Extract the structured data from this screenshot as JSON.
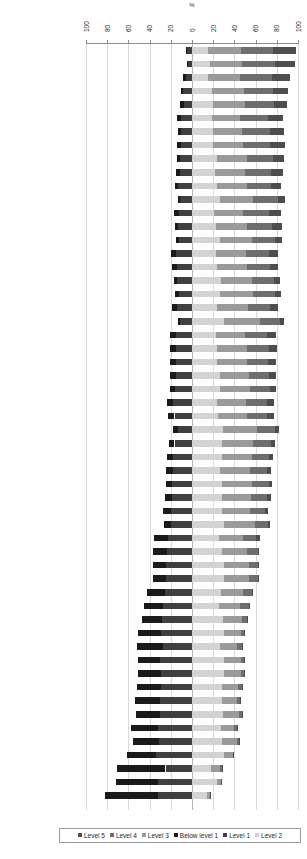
{
  "chart_data": {
    "type": "bar",
    "subtype": "diverging-stacked-bar",
    "title": "",
    "xlabel": "%",
    "ylabel": "",
    "xlim": [
      -100,
      100
    ],
    "xticks": [
      100,
      80,
      60,
      40,
      20,
      0,
      20,
      40,
      60,
      80,
      100
    ],
    "grid": true,
    "legend_position": "bottom",
    "orientation": "horizontal",
    "axis_origin_note": "Bars diverge at 0; below-baseline levels extend left, at/above-baseline levels extend right",
    "negative_series_order": [
      "Level 1",
      "Below level 1"
    ],
    "positive_series_order": [
      "Level 2",
      "Level 3",
      "Level 4",
      "Level 5"
    ],
    "legend_entries": [
      {
        "label": "Level 5",
        "color": "#4d4d4d"
      },
      {
        "label": "Level 4",
        "color": "#6e6e6e"
      },
      {
        "label": "Level 3",
        "color": "#9a9a9a"
      },
      {
        "label": "Below level 1",
        "color": "#1a1a1a"
      },
      {
        "label": "Level 1",
        "color": "#3f3f3f"
      },
      {
        "label": "Level 2",
        "color": "#d3d3d3"
      }
    ],
    "series": [
      {
        "name": "Below level 1",
        "color": "#1a1a1a"
      },
      {
        "name": "Level 1",
        "color": "#3f3f3f"
      },
      {
        "name": "Level 2",
        "color": "#d3d3d3"
      },
      {
        "name": "Level 3",
        "color": "#9a9a9a"
      },
      {
        "name": "Level 4",
        "color": "#6e6e6e"
      },
      {
        "name": "Level 5",
        "color": "#4d4d4d"
      }
    ],
    "categories": [
      "Korea",
      "Finland",
      "Hong Kong-China",
      "Canada",
      "Ireland",
      "New Zealand",
      "Liechtenstein",
      "Australia",
      "Netherlands",
      "Sweden",
      "Poland",
      "Estonia",
      "Belgium",
      "Switzerland",
      "Chinese Taipei",
      "Germany",
      "Japan",
      "Slovenia",
      "Denmark",
      "United Kingdom",
      "Macao-China",
      "France",
      "Austria",
      "Iceland",
      "Norway",
      "Hungary",
      "Czech Republic",
      "Luxembourg",
      "Latvia",
      "Croatia",
      "Portugal",
      "Italy",
      "Lithuania",
      "Slovak Republic",
      "Greece",
      "Spain",
      "Israel",
      "Turkey",
      "Chile",
      "Russian Federation",
      "Uruguay",
      "Bulgaria",
      "Mexico",
      "Thailand",
      "Argentina",
      "Serbia",
      "Jordan",
      "Brazil",
      "Colombia",
      "Romania",
      "Montenegro",
      "Tunisia",
      "Indonesia",
      "Qatar",
      "Azerbaijan",
      "Kyrgyzstan"
    ],
    "values": [
      {
        "country": "Korea",
        "below_level_1": 1.4,
        "level_1": 4.4,
        "level_2": 15.4,
        "level_3": 30.8,
        "level_4": 30.6,
        "level_5": 21.7
      },
      {
        "country": "Finland",
        "below_level_1": 1.1,
        "level_1": 3.7,
        "level_2": 16.7,
        "level_3": 30.7,
        "level_4": 31.1,
        "level_5": 18.5
      },
      {
        "country": "Hong Kong-China",
        "below_level_1": 2.2,
        "level_1": 5.9,
        "level_2": 15.0,
        "level_3": 30.0,
        "level_4": 30.5,
        "level_5": 17.4
      },
      {
        "country": "Canada",
        "below_level_1": 2.4,
        "level_1": 8.1,
        "level_2": 19.0,
        "level_3": 30.0,
        "level_4": 27.0,
        "level_5": 14.5
      },
      {
        "country": "Ireland",
        "below_level_1": 3.3,
        "level_1": 8.0,
        "level_2": 20.0,
        "level_3": 30.0,
        "level_4": 27.5,
        "level_5": 11.7
      },
      {
        "country": "New Zealand",
        "below_level_1": 4.0,
        "level_1": 10.5,
        "level_2": 19.0,
        "level_3": 26.5,
        "level_4": 26.0,
        "level_5": 14.5
      },
      {
        "country": "Liechtenstein",
        "below_level_1": 3.6,
        "level_1": 10.0,
        "level_2": 20.0,
        "level_3": 27.0,
        "level_4": 26.5,
        "level_5": 13.0
      },
      {
        "country": "Australia",
        "below_level_1": 3.8,
        "level_1": 10.3,
        "level_2": 20.0,
        "level_3": 28.0,
        "level_4": 26.0,
        "level_5": 13.5
      },
      {
        "country": "Netherlands",
        "below_level_1": 2.9,
        "level_1": 11.6,
        "level_2": 24.0,
        "level_3": 28.0,
        "level_4": 24.5,
        "level_5": 10.0
      },
      {
        "country": "Sweden",
        "below_level_1": 3.8,
        "level_1": 11.6,
        "level_2": 22.0,
        "level_3": 28.0,
        "level_4": 24.5,
        "level_5": 11.0
      },
      {
        "country": "Poland",
        "below_level_1": 3.2,
        "level_1": 13.0,
        "level_2": 24.0,
        "level_3": 28.0,
        "level_4": 22.5,
        "level_5": 9.0
      },
      {
        "country": "Estonia",
        "below_level_1": 2.0,
        "level_1": 11.0,
        "level_2": 26.0,
        "level_3": 32.0,
        "level_4": 23.0,
        "level_5": 7.0
      },
      {
        "country": "Belgium",
        "below_level_1": 5.0,
        "level_1": 12.4,
        "level_2": 21.0,
        "level_3": 27.0,
        "level_4": 25.0,
        "level_5": 11.0
      },
      {
        "country": "Switzerland",
        "below_level_1": 3.6,
        "level_1": 12.8,
        "level_2": 23.0,
        "level_3": 29.0,
        "level_4": 23.5,
        "level_5": 9.0
      },
      {
        "country": "Chinese Taipei",
        "below_level_1": 2.8,
        "level_1": 12.0,
        "level_2": 26.0,
        "level_3": 30.5,
        "level_4": 22.0,
        "level_5": 6.5
      },
      {
        "country": "Germany",
        "below_level_1": 4.5,
        "level_1": 15.5,
        "level_2": 23.0,
        "level_3": 27.5,
        "level_4": 22.0,
        "level_5": 8.5
      },
      {
        "country": "Japan",
        "below_level_1": 4.4,
        "level_1": 14.5,
        "level_2": 24.0,
        "level_3": 28.0,
        "level_4": 21.5,
        "level_5": 8.0
      },
      {
        "country": "Slovenia",
        "below_level_1": 2.9,
        "level_1": 14.0,
        "level_2": 27.0,
        "level_3": 30.0,
        "level_4": 20.5,
        "level_5": 5.5
      },
      {
        "country": "Denmark",
        "below_level_1": 3.6,
        "level_1": 12.5,
        "level_2": 26.0,
        "level_3": 32.0,
        "level_4": 20.5,
        "level_5": 5.5
      },
      {
        "country": "United Kingdom",
        "below_level_1": 4.9,
        "level_1": 14.1,
        "level_2": 24.0,
        "level_3": 29.0,
        "level_4": 21.0,
        "level_5": 7.5
      },
      {
        "country": "Macao-China",
        "below_level_1": 1.4,
        "level_1": 11.5,
        "level_2": 30.0,
        "level_3": 34.0,
        "level_4": 19.0,
        "level_5": 4.0
      },
      {
        "country": "France",
        "below_level_1": 6.0,
        "level_1": 15.0,
        "level_2": 23.0,
        "level_3": 27.0,
        "level_4": 21.0,
        "level_5": 8.0
      },
      {
        "country": "Austria",
        "below_level_1": 5.3,
        "level_1": 15.0,
        "level_2": 23.5,
        "level_3": 28.0,
        "level_4": 21.0,
        "level_5": 7.5
      },
      {
        "country": "Iceland",
        "below_level_1": 5.8,
        "level_1": 15.2,
        "level_2": 24.0,
        "level_3": 28.0,
        "level_4": 20.0,
        "level_5": 7.0
      },
      {
        "country": "Norway",
        "below_level_1": 5.5,
        "level_1": 15.0,
        "level_2": 26.0,
        "level_3": 28.0,
        "level_4": 19.0,
        "level_5": 6.0
      },
      {
        "country": "Hungary",
        "below_level_1": 4.8,
        "level_1": 16.0,
        "level_2": 26.0,
        "level_3": 29.0,
        "level_4": 19.0,
        "level_5": 5.5
      },
      {
        "country": "Czech Republic",
        "below_level_1": 6.0,
        "level_1": 17.5,
        "level_2": 24.0,
        "level_3": 27.0,
        "level_4": 19.5,
        "level_5": 6.5
      },
      {
        "country": "Luxembourg",
        "below_level_1": 6.5,
        "level_1": 16.5,
        "level_2": 24.5,
        "level_3": 27.0,
        "level_4": 19.5,
        "level_5": 6.0
      },
      {
        "country": "Latvia",
        "below_level_1": 4.0,
        "level_1": 13.5,
        "level_2": 29.0,
        "level_3": 32.0,
        "level_4": 17.5,
        "level_5": 3.5
      },
      {
        "country": "Croatia",
        "below_level_1": 5.2,
        "level_1": 16.5,
        "level_2": 28.0,
        "level_3": 30.0,
        "level_4": 16.5,
        "level_5": 3.5
      },
      {
        "country": "Portugal",
        "below_level_1": 5.6,
        "level_1": 18.0,
        "level_2": 28.0,
        "level_3": 29.0,
        "level_4": 15.5,
        "level_5": 3.5
      },
      {
        "country": "Italy",
        "below_level_1": 7.4,
        "level_1": 17.5,
        "level_2": 26.5,
        "level_3": 28.0,
        "level_4": 16.0,
        "level_5": 4.0
      },
      {
        "country": "Lithuania",
        "below_level_1": 5.8,
        "level_1": 18.5,
        "level_2": 28.0,
        "level_3": 29.0,
        "level_4": 15.5,
        "level_5": 3.0
      },
      {
        "country": "Slovak Republic",
        "below_level_1": 6.2,
        "level_1": 19.0,
        "level_2": 28.0,
        "level_3": 28.0,
        "level_4": 15.0,
        "level_5": 3.5
      },
      {
        "country": "Greece",
        "below_level_1": 7.2,
        "level_1": 20.0,
        "level_2": 28.0,
        "level_3": 27.0,
        "level_4": 14.0,
        "level_5": 3.0
      },
      {
        "country": "Spain",
        "below_level_1": 6.5,
        "level_1": 19.5,
        "level_2": 30.0,
        "level_3": 29.0,
        "level_4": 12.5,
        "level_5": 2.0
      },
      {
        "country": "Israel",
        "below_level_1": 13.0,
        "level_1": 23.0,
        "level_2": 25.0,
        "level_3": 23.0,
        "level_4": 12.5,
        "level_5": 3.5
      },
      {
        "country": "Turkey",
        "below_level_1": 12.5,
        "level_1": 24.0,
        "level_2": 28.0,
        "level_3": 24.0,
        "level_4": 10.0,
        "level_5": 1.5
      },
      {
        "country": "Chile",
        "below_level_1": 12.0,
        "level_1": 24.5,
        "level_2": 30.0,
        "level_3": 24.0,
        "level_4": 8.5,
        "level_5": 1.0
      },
      {
        "country": "Russian Federation",
        "below_level_1": 12.0,
        "level_1": 24.5,
        "level_2": 30.0,
        "level_3": 24.0,
        "level_4": 8.5,
        "level_5": 1.0
      },
      {
        "country": "Uruguay",
        "below_level_1": 16.5,
        "level_1": 25.5,
        "level_2": 27.0,
        "level_3": 21.0,
        "level_4": 8.5,
        "level_5": 1.5
      },
      {
        "country": "Bulgaria",
        "below_level_1": 18.0,
        "level_1": 27.0,
        "level_2": 25.0,
        "level_3": 20.0,
        "level_4": 8.5,
        "level_5": 1.5
      },
      {
        "country": "Mexico",
        "below_level_1": 18.5,
        "level_1": 28.5,
        "level_2": 29.0,
        "level_3": 18.0,
        "level_4": 5.0,
        "level_5": 0.5
      },
      {
        "country": "Thailand",
        "below_level_1": 21.0,
        "level_1": 29.5,
        "level_2": 30.0,
        "level_3": 16.0,
        "level_4": 3.0,
        "level_5": 0.3
      },
      {
        "country": "Argentina",
        "below_level_1": 24.0,
        "level_1": 27.5,
        "level_2": 26.0,
        "level_3": 16.0,
        "level_4": 5.0,
        "level_5": 0.5
      },
      {
        "country": "Serbia",
        "below_level_1": 21.0,
        "level_1": 30.0,
        "level_2": 30.0,
        "level_3": 16.0,
        "level_4": 3.0,
        "level_5": 0.3
      },
      {
        "country": "Jordan",
        "below_level_1": 22.0,
        "level_1": 29.0,
        "level_2": 30.0,
        "level_3": 16.0,
        "level_4": 3.0,
        "level_5": 0.3
      },
      {
        "country": "Brazil",
        "below_level_1": 23.0,
        "level_1": 29.0,
        "level_2": 28.0,
        "level_3": 15.0,
        "level_4": 4.0,
        "level_5": 0.5
      },
      {
        "country": "Colombia",
        "below_level_1": 23.5,
        "level_1": 30.5,
        "level_2": 28.0,
        "level_3": 14.5,
        "level_4": 3.0,
        "level_5": 0.3
      },
      {
        "country": "Romania",
        "below_level_1": 23.0,
        "level_1": 30.0,
        "level_2": 29.0,
        "level_3": 15.0,
        "level_4": 3.0,
        "level_5": 0.3
      },
      {
        "country": "Montenegro",
        "below_level_1": 25.5,
        "level_1": 32.0,
        "level_2": 27.0,
        "level_3": 13.0,
        "level_4": 2.0,
        "level_5": 0.2
      },
      {
        "country": "Tunisia",
        "below_level_1": 24.5,
        "level_1": 31.5,
        "level_2": 28.0,
        "level_3": 14.0,
        "level_4": 2.0,
        "level_5": 0.2
      },
      {
        "country": "Indonesia",
        "below_level_1": 27.5,
        "level_1": 33.5,
        "level_2": 30.0,
        "level_3": 8.5,
        "level_4": 0.5,
        "level_5": 0.1
      },
      {
        "country": "Qatar",
        "below_level_1": 46.0,
        "level_1": 25.0,
        "level_2": 18.0,
        "level_3": 8.0,
        "level_4": 2.0,
        "level_5": 0.3
      },
      {
        "country": "Azerbaijan",
        "below_level_1": 40.0,
        "level_1": 32.0,
        "level_2": 24.0,
        "level_3": 3.5,
        "level_4": 0.3,
        "level_5": 0.1
      },
      {
        "country": "Kyrgyzstan",
        "below_level_1": 50.0,
        "level_1": 32.0,
        "level_2": 14.0,
        "level_3": 3.0,
        "level_4": 0.3,
        "level_5": 0.1
      }
    ]
  },
  "axis": {
    "unit_label": "%",
    "ticks": [
      "100",
      "80",
      "60",
      "40",
      "20",
      "0",
      "20",
      "40",
      "60",
      "80",
      "100"
    ]
  },
  "legend": {
    "items": [
      "Level 5",
      "Level 4",
      "Level 3",
      "Below level 1",
      "Level 1",
      "Level 2"
    ]
  }
}
